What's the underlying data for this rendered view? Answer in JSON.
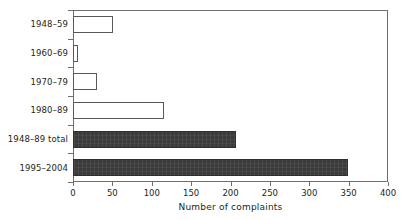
{
  "chart_data": {
    "type": "bar",
    "orientation": "horizontal",
    "title": "",
    "xlabel": "Number of complaints",
    "ylabel": "",
    "xlim": [
      0,
      400
    ],
    "xticks": [
      0,
      50,
      100,
      150,
      200,
      250,
      300,
      350,
      400
    ],
    "grid": false,
    "legend": false,
    "categories": [
      "1948–59",
      "1960–69",
      "1970–79",
      "1980–89",
      "1948–89 total",
      "1995–2004"
    ],
    "values": [
      51,
      6,
      30,
      115,
      207,
      349
    ],
    "bar_styles": [
      "open",
      "open",
      "open",
      "open",
      "filled",
      "filled"
    ],
    "colors": {
      "open_bar_fill": "#ffffff",
      "open_bar_stroke": "#58595b",
      "filled_bar_fill": "#3b3b3b",
      "axis": "#6d6e71",
      "text": "#231f20",
      "background": "#ffffff"
    }
  }
}
